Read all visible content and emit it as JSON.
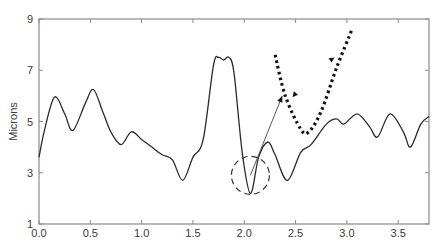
{
  "chart_data": {
    "type": "line",
    "title": "",
    "xlabel": "",
    "ylabel": "Microns",
    "xlim": [
      0,
      3.8
    ],
    "ylim": [
      1,
      9
    ],
    "xticks": [
      0.0,
      0.5,
      1.0,
      1.5,
      2.0,
      2.5,
      3.0,
      3.5
    ],
    "xtick_labels": [
      "0.0",
      "0.5",
      "1.0",
      "1.5",
      "2.0",
      "2.5",
      "3.0",
      "3.5"
    ],
    "yticks": [
      1,
      3,
      5,
      7,
      9
    ],
    "ytick_labels": [
      "1",
      "3",
      "5",
      "7",
      "9"
    ],
    "grid": false,
    "legend": null,
    "series": [
      {
        "name": "profile",
        "style": "solid",
        "color": "#2a2a2a",
        "x": [
          0.0,
          0.05,
          0.15,
          0.25,
          0.33,
          0.45,
          0.53,
          0.62,
          0.7,
          0.8,
          0.9,
          1.0,
          1.1,
          1.2,
          1.3,
          1.4,
          1.5,
          1.6,
          1.7,
          1.75,
          1.8,
          1.85,
          1.9,
          1.98,
          2.06,
          2.14,
          2.23,
          2.3,
          2.42,
          2.55,
          2.65,
          2.8,
          2.9,
          2.97,
          3.1,
          3.22,
          3.3,
          3.42,
          3.55,
          3.62,
          3.72,
          3.8
        ],
        "y": [
          3.6,
          4.6,
          5.95,
          5.3,
          4.65,
          5.7,
          6.25,
          5.4,
          4.6,
          4.1,
          4.6,
          4.3,
          4.0,
          3.7,
          3.5,
          2.7,
          3.6,
          4.3,
          7.2,
          7.5,
          7.4,
          7.5,
          6.9,
          3.8,
          2.2,
          3.6,
          4.2,
          3.7,
          2.7,
          3.8,
          4.1,
          4.9,
          5.1,
          4.9,
          5.3,
          4.8,
          4.4,
          5.3,
          4.6,
          4.0,
          4.9,
          5.2
        ]
      },
      {
        "name": "zoomed-inset",
        "style": "dotted",
        "color": "#111111",
        "x": [
          2.3,
          2.4,
          2.55,
          2.63,
          2.75,
          2.9,
          3.05
        ],
        "y": [
          7.6,
          6.0,
          4.7,
          4.6,
          5.4,
          7.1,
          8.6
        ]
      }
    ],
    "annotations": [
      {
        "type": "dashed-circle",
        "center": [
          2.06,
          2.9
        ],
        "radius_px": 19,
        "note": "highlights minimum near x=2.06, y=2.2"
      },
      {
        "type": "arrow",
        "from": [
          2.06,
          2.9
        ],
        "to": [
          2.37,
          6.0
        ],
        "note": "thin arrow from circle to dotted curve"
      },
      {
        "type": "arrowhead",
        "at": [
          2.47,
          5.95
        ],
        "direction": "down-left"
      },
      {
        "type": "arrowhead",
        "at": [
          2.88,
          7.5
        ],
        "direction": "up-right"
      }
    ]
  }
}
